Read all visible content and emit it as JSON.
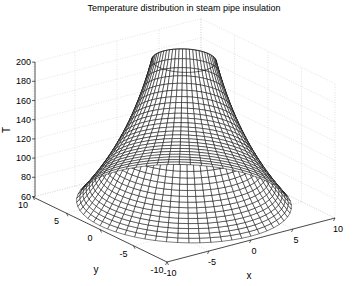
{
  "chart_data": {
    "type": "surface-mesh",
    "title": "Temperature distribution in steam pipe insulation",
    "xlabel": "x",
    "ylabel": "y",
    "zlabel": "T",
    "xlim": [
      -10,
      10
    ],
    "ylim": [
      -10,
      10
    ],
    "zlim": [
      60,
      200
    ],
    "xticks": [
      "-10",
      "-5",
      "0",
      "5",
      "10"
    ],
    "yticks": [
      "-10",
      "-5",
      "0",
      "5",
      "10"
    ],
    "zticks": [
      "60",
      "80",
      "100",
      "120",
      "140",
      "160",
      "180",
      "200"
    ],
    "grid": true,
    "surface": {
      "shape": "axisymmetric, log profile",
      "inner_radius": 3,
      "outer_radius": 10,
      "T_inner": 213,
      "T_outer": 64,
      "radial_rings": 24,
      "angular_segments": 60,
      "edge_color": "#000000",
      "face_color": "#ffffff"
    },
    "colors": {
      "grid": "#d0d0d0",
      "axis": "#000000",
      "mesh": "#111111"
    }
  }
}
